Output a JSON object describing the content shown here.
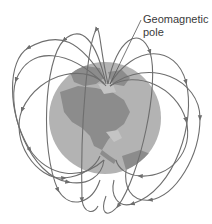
{
  "figure": {
    "label_lines": [
      "Geomagnetic",
      "pole"
    ],
    "colors": {
      "background": "#ffffff",
      "ocean": "#b3b3b3",
      "land": "#8c8c8c",
      "field_lines": "#6e6e6e",
      "label_text": "#3a3a3a"
    }
  }
}
